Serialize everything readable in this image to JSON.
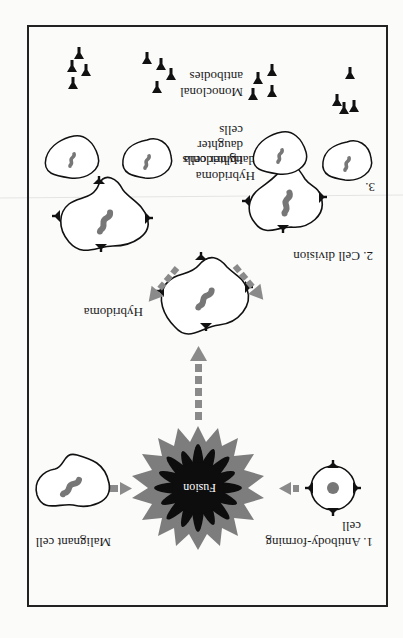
{
  "diagram": {
    "orientation": "rotated-180",
    "steps": {
      "step1": {
        "label_line1": "1. Antibody-forming",
        "label_line2": "cell"
      },
      "step2": {
        "label": "2. Cell division"
      },
      "step3": {
        "label": "3."
      }
    },
    "labels": {
      "malignant_cell": "Malignant cell",
      "fusion": "Fusion",
      "hybridoma": "Hybridoma",
      "hybridoma_daughter_line1": "Hybridoma",
      "hybridoma_daughter_line2": "daughter cells",
      "step3_daughter_line1": "Hybridoma",
      "step3_daughter_line2": "daughter",
      "step3_daughter_line3": "cells",
      "monoclonal_line1": "Monoclonal",
      "monoclonal_line2": "antibodies"
    },
    "colors": {
      "outline": "#111111",
      "nucleus": "#777777",
      "arrow": "#8a8a8a",
      "fusion_outer": "#7d7d7d",
      "fusion_inner": "#0d0d0d",
      "antibody": "#111111"
    }
  }
}
